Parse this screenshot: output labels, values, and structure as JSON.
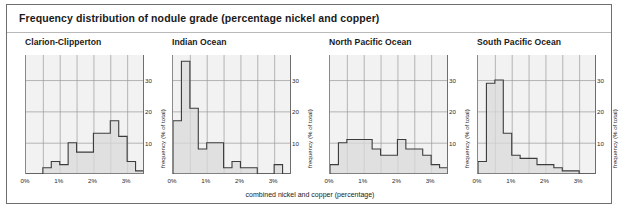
{
  "figure": {
    "title": "Frequency distribution of nodule grade (percentage nickel and copper)",
    "xaxis_title": "combined nickel and copper (percentage)",
    "yaxis_title": "frequency (% of total)"
  },
  "axis": {
    "x_ticks": [
      "0%",
      "1%",
      "2%",
      "3%"
    ],
    "x_tick_values": [
      0,
      1,
      2,
      3
    ],
    "y_ticks": [
      "10",
      "20",
      "30"
    ],
    "y_tick_values": [
      10,
      20,
      30
    ],
    "xlim": [
      0,
      3.5
    ],
    "ylim": [
      0,
      38
    ]
  },
  "colors": {
    "border": "#6e6e6e",
    "plot_background": "#f2f2f2",
    "gridline": "#9a9a9a",
    "step_line": "#3c3c3c",
    "fill": "#d9d9d9",
    "text": "#1a1a1a"
  },
  "chart_data": [
    {
      "type": "bar",
      "title": "Clarion-Clipperton",
      "xlabel": "combined nickel and copper (percentage)",
      "ylabel": "frequency (% of total)",
      "xlim": [
        0,
        3.5
      ],
      "ylim": [
        0,
        38
      ],
      "grid": true,
      "bin_width": 0.25,
      "bin_edges": [
        0,
        0.25,
        0.5,
        0.75,
        1.0,
        1.25,
        1.5,
        1.75,
        2.0,
        2.25,
        2.5,
        2.75,
        3.0,
        3.25,
        3.5
      ],
      "categories": [
        "0.00-0.25",
        "0.25-0.50",
        "0.50-0.75",
        "0.75-1.00",
        "1.00-1.25",
        "1.25-1.50",
        "1.50-1.75",
        "1.75-2.00",
        "2.00-2.25",
        "2.25-2.50",
        "2.50-2.75",
        "2.75-3.00",
        "3.00-3.25",
        "3.25-3.50"
      ],
      "values": [
        0,
        0,
        2,
        4,
        3,
        10,
        7,
        7,
        13,
        13,
        17,
        12,
        4,
        1
      ]
    },
    {
      "type": "bar",
      "title": "Indian Ocean",
      "xlabel": "combined nickel and copper (percentage)",
      "ylabel": "frequency (% of total)",
      "xlim": [
        0,
        3.5
      ],
      "ylim": [
        0,
        38
      ],
      "grid": true,
      "bin_width": 0.25,
      "bin_edges": [
        0,
        0.25,
        0.5,
        0.75,
        1.0,
        1.25,
        1.5,
        1.75,
        2.0,
        2.25,
        2.5,
        2.75,
        3.0,
        3.25,
        3.5
      ],
      "categories": [
        "0.00-0.25",
        "0.25-0.50",
        "0.50-0.75",
        "0.75-1.00",
        "1.00-1.25",
        "1.25-1.50",
        "1.50-1.75",
        "1.75-2.00",
        "2.00-2.25",
        "2.25-2.50",
        "2.50-2.75",
        "2.75-3.00",
        "3.00-3.25",
        "3.25-3.50"
      ],
      "values": [
        17,
        36,
        21,
        8,
        10,
        10,
        2,
        4,
        2,
        2,
        0,
        0,
        3,
        0
      ]
    },
    {
      "type": "bar",
      "title": "North Pacific Ocean",
      "xlabel": "combined nickel and copper (percentage)",
      "ylabel": "frequency (% of total)",
      "xlim": [
        0,
        3.5
      ],
      "ylim": [
        0,
        38
      ],
      "grid": true,
      "bin_width": 0.25,
      "bin_edges": [
        0,
        0.25,
        0.5,
        0.75,
        1.0,
        1.25,
        1.5,
        1.75,
        2.0,
        2.25,
        2.5,
        2.75,
        3.0,
        3.25,
        3.5
      ],
      "categories": [
        "0.00-0.25",
        "0.25-0.50",
        "0.50-0.75",
        "0.75-1.00",
        "1.00-1.25",
        "1.25-1.50",
        "1.50-1.75",
        "1.75-2.00",
        "2.00-2.25",
        "2.25-2.50",
        "2.50-2.75",
        "2.75-3.00",
        "3.00-3.25",
        "3.25-3.50"
      ],
      "values": [
        3,
        10,
        11,
        11,
        11,
        8,
        6,
        6,
        11,
        8,
        8,
        6,
        3,
        2
      ]
    },
    {
      "type": "bar",
      "title": "South Pacific Ocean",
      "xlabel": "combined nickel and copper (percentage)",
      "ylabel": "frequency (% of total)",
      "xlim": [
        0,
        3.5
      ],
      "ylim": [
        0,
        38
      ],
      "grid": true,
      "bin_width": 0.25,
      "bin_edges": [
        0,
        0.25,
        0.5,
        0.75,
        1.0,
        1.25,
        1.5,
        1.75,
        2.0,
        2.25,
        2.5,
        2.75,
        3.0,
        3.25,
        3.5
      ],
      "categories": [
        "0.00-0.25",
        "0.25-0.50",
        "0.50-0.75",
        "0.75-1.00",
        "1.00-1.25",
        "1.25-1.50",
        "1.50-1.75",
        "1.75-2.00",
        "2.00-2.25",
        "2.25-2.50",
        "2.50-2.75",
        "2.75-3.00",
        "3.00-3.25",
        "3.25-3.50"
      ],
      "values": [
        4,
        29,
        30,
        13,
        6,
        5,
        5,
        3,
        3,
        2,
        1,
        1,
        0,
        0
      ]
    }
  ]
}
